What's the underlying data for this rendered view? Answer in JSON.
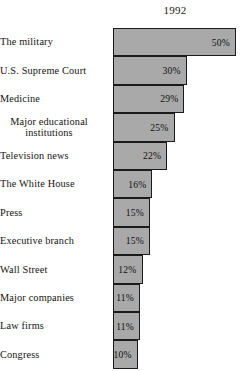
{
  "chart_data": {
    "type": "bar",
    "title": "",
    "subtitle": "",
    "column_header": "1992",
    "xlabel": "",
    "ylabel": "",
    "xlim": [
      0,
      50
    ],
    "grid": false,
    "legend": null,
    "orientation": "horizontal",
    "value_suffix": "%",
    "categories": [
      "The military",
      "U.S. Supreme Court",
      "Medicine",
      "Major educational institutions",
      "Television news",
      "The White House",
      "Press",
      "Executive branch",
      "Wall Street",
      "Major companies",
      "Law firms",
      "Congress"
    ],
    "values": [
      50,
      30,
      29,
      25,
      22,
      16,
      15,
      15,
      12,
      11,
      11,
      10
    ],
    "labels": [
      "50%",
      "30%",
      "29%",
      "25%",
      "22%",
      "16%",
      "15%",
      "15%",
      "12%",
      "11%",
      "11%",
      "10%"
    ],
    "colors": {
      "bar_fill": "#a9a9a9",
      "bar_border": "#1b1b1b",
      "text": "#141414",
      "background": "#ffffff"
    }
  },
  "rows": [
    {
      "label": "The military",
      "label_line1": "Major educational",
      "value_label": "50%",
      "value": 50,
      "two_line": false
    },
    {
      "label": "U.S. Supreme Court",
      "value_label": "30%",
      "value": 30,
      "two_line": false
    },
    {
      "label": "Medicine",
      "value_label": "29%",
      "value": 29,
      "two_line": false
    },
    {
      "label": "Major educational institutions",
      "line1": "Major educational",
      "line2": "institutions",
      "value_label": "25%",
      "value": 25,
      "two_line": true
    },
    {
      "label": "Television news",
      "value_label": "22%",
      "value": 22,
      "two_line": false
    },
    {
      "label": "The White House",
      "value_label": "16%",
      "value": 16,
      "two_line": false
    },
    {
      "label": "Press",
      "value_label": "15%",
      "value": 15,
      "two_line": false
    },
    {
      "label": "Executive branch",
      "value_label": "15%",
      "value": 15,
      "two_line": false
    },
    {
      "label": "Wall Street",
      "value_label": "12%",
      "value": 12,
      "two_line": false
    },
    {
      "label": "Major companies",
      "value_label": "11%",
      "value": 11,
      "two_line": false
    },
    {
      "label": "Law firms",
      "value_label": "11%",
      "value": 11,
      "two_line": false
    },
    {
      "label": "Congress",
      "value_label": "10%",
      "value": 10,
      "two_line": false
    }
  ],
  "header": {
    "year": "1992"
  }
}
